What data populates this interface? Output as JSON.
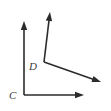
{
  "figure": {
    "background_color": "#ffffff",
    "stroke_color": "#2b2b2b",
    "label_color": "#3a3a3a",
    "stroke_width": 1.6,
    "width": 111,
    "height": 111,
    "labels": {
      "c": "C",
      "d": "D"
    },
    "label_positions": {
      "c": {
        "x": 9,
        "y": 99
      },
      "d": {
        "x": 29,
        "y": 70
      }
    },
    "vertices": [
      {
        "name": "C",
        "x": 24,
        "y": 95
      },
      {
        "name": "D",
        "x": 44,
        "y": 62
      }
    ],
    "rays": [
      {
        "name": "ray-c-up",
        "from_vertex": "C",
        "start": {
          "x": 24,
          "y": 95
        },
        "end": {
          "x": 24,
          "y": 21
        },
        "arrowhead": true,
        "direction": "up"
      },
      {
        "name": "ray-c-right",
        "from_vertex": "C",
        "start": {
          "x": 24,
          "y": 95
        },
        "end": {
          "x": 84,
          "y": 95
        },
        "arrowhead": true,
        "direction": "right"
      },
      {
        "name": "ray-d-up-right",
        "from_vertex": "D",
        "start": {
          "x": 44,
          "y": 62
        },
        "end": {
          "x": 50,
          "y": 12
        },
        "arrowhead": true,
        "direction": "up-right"
      },
      {
        "name": "ray-d-down-right",
        "from_vertex": "D",
        "start": {
          "x": 44,
          "y": 62
        },
        "end": {
          "x": 101,
          "y": 82
        },
        "arrowhead": true,
        "direction": "down-right"
      }
    ],
    "arrowhead": {
      "length": 9,
      "half_width": 3.2
    }
  }
}
